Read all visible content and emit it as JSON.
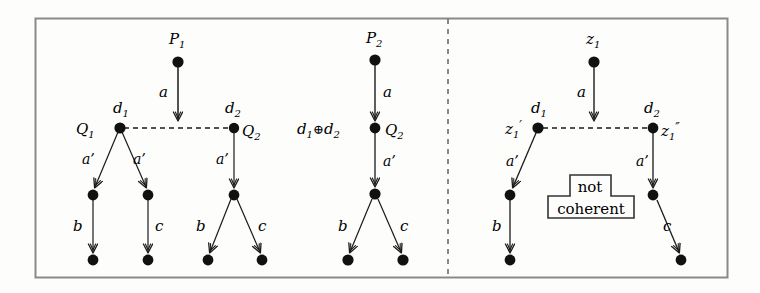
{
  "figure": {
    "background_color": "#fdfdfc",
    "stroke_color": "#1a1a1a",
    "border_color": "#8a8a88",
    "divider_style": "dashed-vertical",
    "panels": [
      {
        "name": "left-panel",
        "description": "P1 with two separate d1 and d2 derivation trees"
      },
      {
        "name": "middle-panel",
        "description": "P2 with merged d1 xor d2 derivation tree"
      },
      {
        "name": "right-panel",
        "description": "z1 with non-coherent derivation"
      }
    ]
  },
  "nodes": {
    "p1": {
      "label": "P1",
      "text": "P",
      "sub": "1"
    },
    "p2": {
      "label": "P2",
      "text": "P",
      "sub": "2"
    },
    "z1": {
      "label": "z1",
      "text": "z",
      "sub": "1"
    },
    "q1": {
      "label": "Q1",
      "text": "Q",
      "sub": "1"
    },
    "q2_left": {
      "label": "Q2",
      "text": "Q",
      "sub": "2"
    },
    "q2_mid": {
      "label": "Q2",
      "text": "Q",
      "sub": "2"
    },
    "d1_left": {
      "label": "d1",
      "text": "d",
      "sub": "1"
    },
    "d2_left": {
      "label": "d2",
      "text": "d",
      "sub": "2"
    },
    "d1_right": {
      "label": "d1",
      "text": "d",
      "sub": "1"
    },
    "d2_right": {
      "label": "d2",
      "text": "d",
      "sub": "2"
    },
    "d1xord2": {
      "label": "d1 + d2",
      "text_a": "d",
      "sub_a": "1",
      "op": "⊕",
      "text_b": "d",
      "sub_b": "2"
    },
    "z1prime": {
      "label": "z1'",
      "text": "z",
      "sub": "1",
      "prime": "′"
    },
    "z1dprime": {
      "label": "z1''",
      "text": "z",
      "sub": "1",
      "prime": "″"
    }
  },
  "edge_labels": {
    "a": "a",
    "a_prime": "a’",
    "b": "b",
    "c": "c"
  },
  "annotation_box": {
    "line1": "not",
    "line2": "coherent"
  }
}
